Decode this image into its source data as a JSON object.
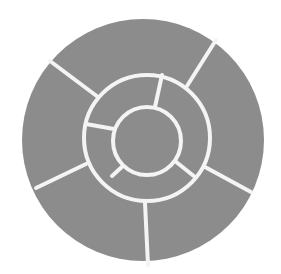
{
  "diagram": {
    "type": "concentric-segmented-circle",
    "colors": {
      "background": "#ffffff",
      "stone": "#8c8c8c",
      "joint": "#f4f4f4"
    },
    "center_disc": {
      "cx": 147,
      "cy": 141,
      "r": 34
    },
    "inner_ring": {
      "cx": 147,
      "cy": 138,
      "r_outer": 63,
      "segment_count": 4,
      "dividers": [
        {
          "x1": 162,
          "y1": 75,
          "x2": 155,
          "y2": 107
        },
        {
          "x1": 86,
          "y1": 124,
          "x2": 114,
          "y2": 129
        },
        {
          "x1": 112,
          "y1": 176,
          "x2": 124,
          "y2": 165
        },
        {
          "x1": 175,
          "y1": 161,
          "x2": 195,
          "y2": 177
        }
      ]
    },
    "outer_ring": {
      "cx": 143,
      "cy": 140,
      "r_outer": 121,
      "segment_count": 5,
      "dividers": [
        {
          "x1": 216,
          "y1": 40,
          "x2": 187,
          "y2": 86
        },
        {
          "x1": 50,
          "y1": 61,
          "x2": 98,
          "y2": 97
        },
        {
          "x1": 36,
          "y1": 188,
          "x2": 86,
          "y2": 164
        },
        {
          "x1": 145,
          "y1": 203,
          "x2": 148,
          "y2": 265
        },
        {
          "x1": 251,
          "y1": 192,
          "x2": 205,
          "y2": 167
        }
      ]
    },
    "joint_width": 4
  }
}
